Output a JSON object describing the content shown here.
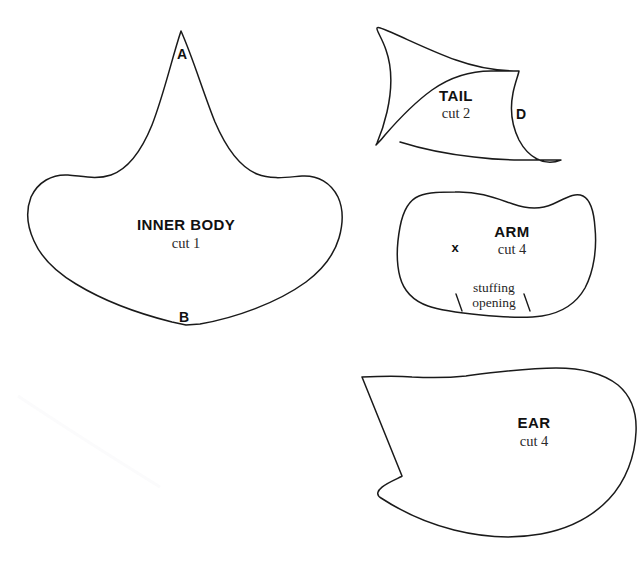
{
  "document": {
    "type": "sewing-pattern-sheet",
    "background_color": "#ffffff",
    "line_color": "#1a1a1a",
    "width": 638,
    "height": 569
  },
  "pieces": [
    {
      "id": "inner-body",
      "name": "INNER BODY",
      "cut": "cut 1",
      "label_x": 186,
      "label_y": 224,
      "cut_x": 186,
      "cut_y": 243,
      "notations": [
        {
          "id": "point-a",
          "text": "A",
          "x": 182,
          "y": 54
        },
        {
          "id": "point-b",
          "text": "B",
          "x": 184,
          "y": 317
        }
      ]
    },
    {
      "id": "tail",
      "name": "TAIL",
      "cut": "cut 2",
      "label_x": 456,
      "label_y": 95,
      "cut_x": 456,
      "cut_y": 113,
      "notations": [
        {
          "id": "point-d",
          "text": "D",
          "x": 521,
          "y": 114
        }
      ]
    },
    {
      "id": "arm",
      "name": "ARM",
      "cut": "cut 4",
      "label_x": 512,
      "label_y": 231,
      "cut_x": 512,
      "cut_y": 249,
      "notations": [
        {
          "id": "placement-x-mark",
          "text": "x",
          "x": 455,
          "y": 247
        }
      ],
      "note": {
        "id": "stuffing-opening-note",
        "line1": "stuffing",
        "line2": "opening",
        "x": 494,
        "y": 295
      }
    },
    {
      "id": "ear",
      "name": "EAR",
      "cut": "cut 4",
      "label_x": 534,
      "label_y": 422,
      "cut_x": 534,
      "cut_y": 441
    }
  ]
}
